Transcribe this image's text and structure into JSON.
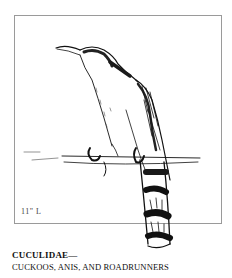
{
  "illustration": {
    "subject": "cuckoo perched on branch",
    "size_label": "11\" L"
  },
  "caption": {
    "family": "CUCULIDAE—",
    "common_names": "CUCKOOS, ANIS, AND ROADRUNNERS"
  }
}
